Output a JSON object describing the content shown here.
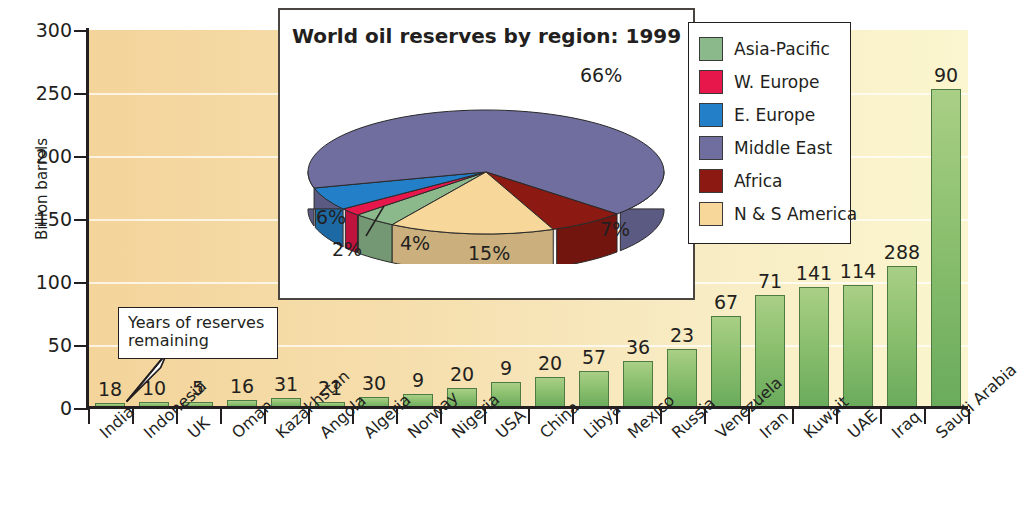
{
  "chart_data": {
    "type": "bar",
    "title": "",
    "xlabel": "",
    "ylabel": "Billion barrels",
    "ylim": [
      0,
      300
    ],
    "yticks": [
      0,
      50,
      100,
      150,
      200,
      250,
      300
    ],
    "grid": true,
    "categories": [
      "India",
      "Indonesia",
      "UK",
      "Oman",
      "Kazakhstan",
      "Angola",
      "Algeria",
      "Norway",
      "Nigeria",
      "USA",
      "China",
      "Libya",
      "Mexico",
      "Russia",
      "Venezuela",
      "Iran",
      "Kuwait",
      "UAE",
      "Iraq",
      "Saudi Arabia"
    ],
    "values": [
      4,
      5,
      5,
      6,
      8,
      5,
      9,
      11,
      16,
      21,
      25,
      29,
      37,
      47,
      73,
      90,
      96,
      98,
      113,
      253
    ],
    "data_labels": [
      "18",
      "10",
      "5",
      "16",
      "31",
      "21",
      "30",
      "9",
      "20",
      "9",
      "20",
      "57",
      "36",
      "23",
      "67",
      "71",
      "141",
      "114",
      "288",
      "90"
    ],
    "data_label_meaning": "Years of reserves remaining",
    "annotation": {
      "text_line1": "Years of reserves",
      "text_line2": "remaining",
      "points_to": "India"
    },
    "series_name": "Oil reserves",
    "bar_color": "#8cc06f"
  },
  "inset": {
    "title": "World oil reserves by region: 1999",
    "chart_data": {
      "type": "pie",
      "title": "World oil reserves by region: 1999",
      "labels": [
        "Asia-Pacific",
        "W. Europe",
        "E. Europe",
        "Middle East",
        "Africa",
        "N & S America"
      ],
      "values": [
        4,
        2,
        6,
        66,
        7,
        15
      ],
      "display_values": [
        "4%",
        "2%",
        "6%",
        "66%",
        "7%",
        "15%"
      ],
      "colors": [
        "#8cb98c",
        "#e8174b",
        "#2380c8",
        "#6f6e9e",
        "#8c1a12",
        "#f8d79a"
      ],
      "legend_position": "right",
      "three_d": true
    }
  },
  "legend": {
    "items": [
      {
        "label": "Asia-Pacific",
        "color": "#8cb98c"
      },
      {
        "label": "W. Europe",
        "color": "#e8174b"
      },
      {
        "label": "E. Europe",
        "color": "#2380c8"
      },
      {
        "label": "Middle East",
        "color": "#6f6e9e"
      },
      {
        "label": "Africa",
        "color": "#8c1a12"
      },
      {
        "label": "N & S America",
        "color": "#f8d79a"
      }
    ]
  }
}
